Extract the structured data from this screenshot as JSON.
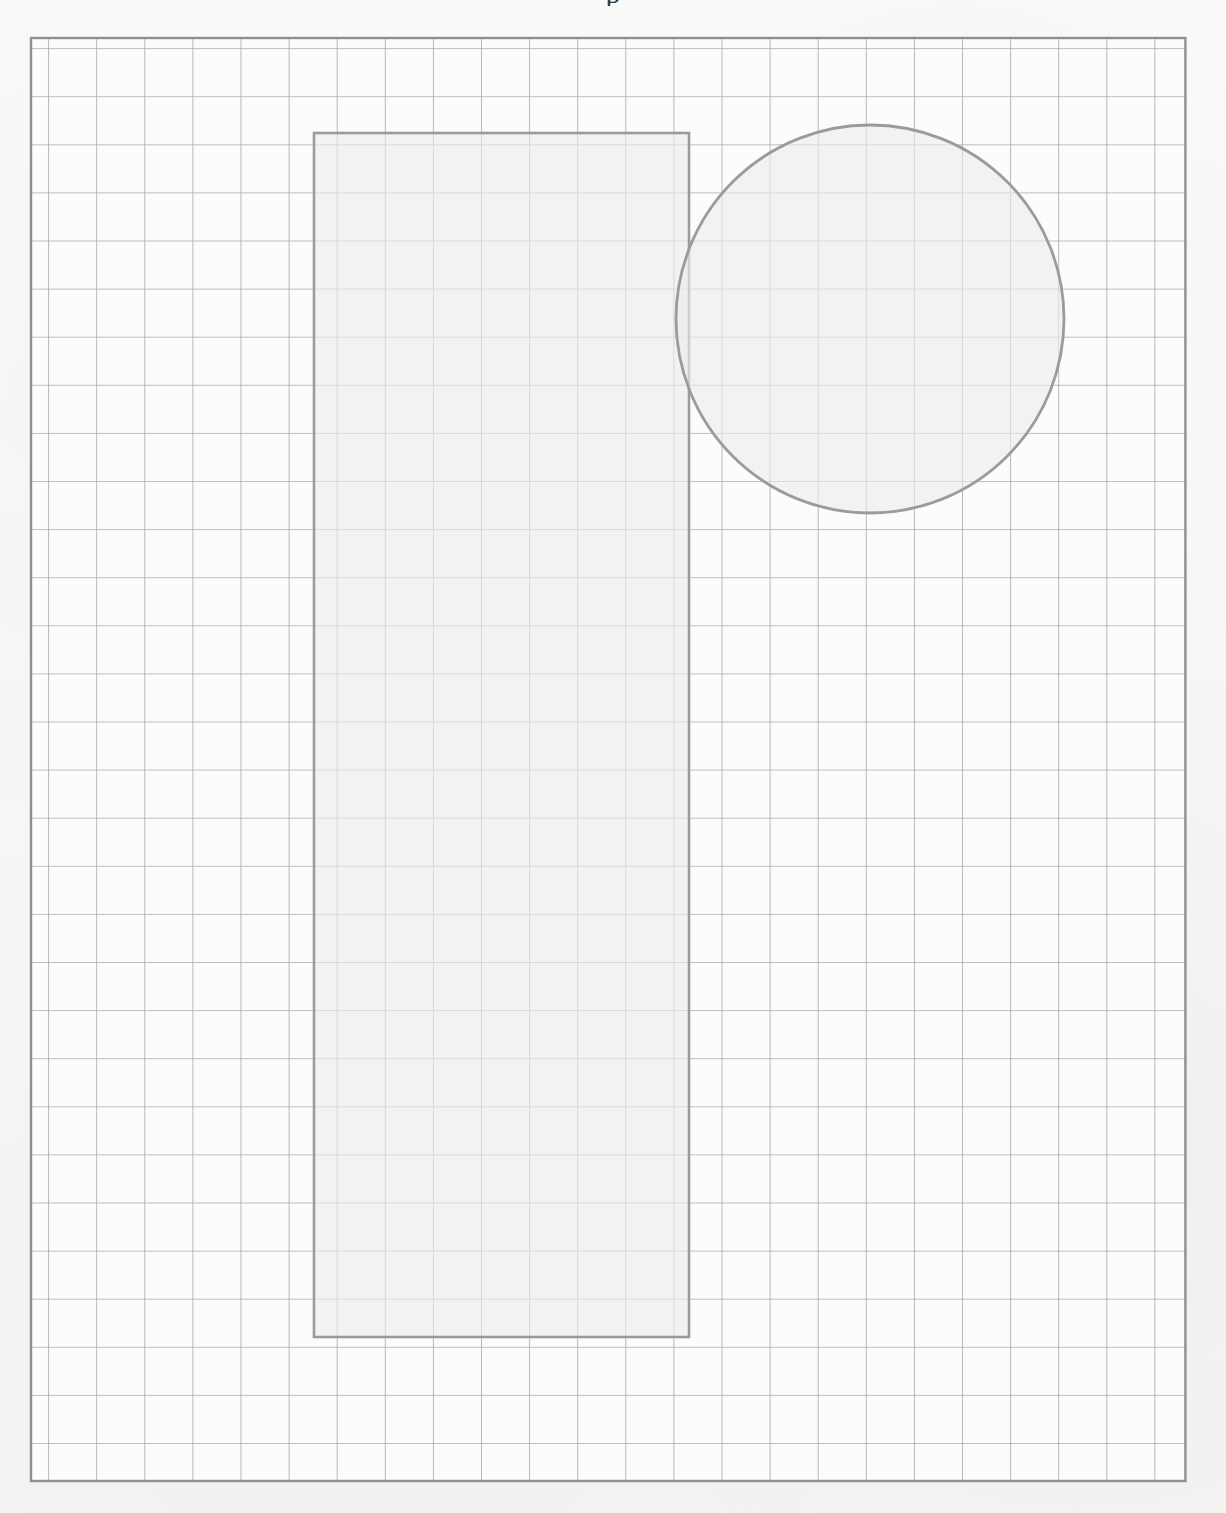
{
  "document": {
    "type": "grid-paper-worksheet",
    "background_color": "#f8f8f6",
    "title_fragment": "p"
  },
  "grid": {
    "name": "square-grid",
    "origin_x": 31,
    "origin_y": 38,
    "cell_size": 48.1,
    "columns": 24,
    "rows": 30,
    "line_color": "#a9a9a9",
    "border_color": "#8f8f8f",
    "line_width": 1.6,
    "border_width": 2.4,
    "cell_fill": "#fcfcfb"
  },
  "shapes": [
    {
      "name": "rectangle",
      "kind": "rect",
      "x": 314,
      "y": 133,
      "width": 375,
      "height": 1204,
      "grid_cells_wide": 7.8,
      "grid_cells_tall": 25,
      "fill": "#ebebeb",
      "fill_opacity": 0.62,
      "stroke": "#9b9b9b",
      "stroke_width": 2.6
    },
    {
      "name": "circle",
      "kind": "circle",
      "cx": 870,
      "cy": 319,
      "r": 194,
      "grid_cells_diameter": 8.1,
      "fill": "#ebebeb",
      "fill_opacity": 0.62,
      "stroke": "#9b9b9b",
      "stroke_width": 2.8
    }
  ]
}
